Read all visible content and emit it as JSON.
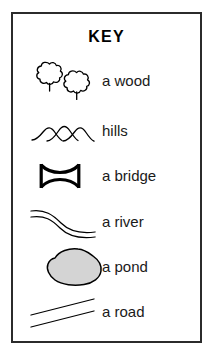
{
  "panel": {
    "title": "KEY",
    "border_color": "#2b2b2b",
    "background_color": "#ffffff"
  },
  "legend": {
    "items": [
      {
        "id": "wood",
        "label": "a wood",
        "icon": "two-trees-icon",
        "stroke_color": "#000000",
        "fill_color": "none"
      },
      {
        "id": "hills",
        "label": "hills",
        "icon": "three-arcs-hills-icon",
        "stroke_color": "#000000",
        "fill_color": "none"
      },
      {
        "id": "bridge",
        "label": "a bridge",
        "icon": "bridge-icon",
        "stroke_color": "#000000",
        "fill_color": "none"
      },
      {
        "id": "river",
        "label": "a river",
        "icon": "double-wavy-line-river-icon",
        "stroke_color": "#000000",
        "fill_color": "none"
      },
      {
        "id": "pond",
        "label": "a pond",
        "icon": "filled-blob-pond-icon",
        "stroke_color": "#000000",
        "fill_color": "#d4d4d4"
      },
      {
        "id": "road",
        "label": "a road",
        "icon": "double-diagonal-line-road-icon",
        "stroke_color": "#000000",
        "fill_color": "none"
      }
    ]
  }
}
